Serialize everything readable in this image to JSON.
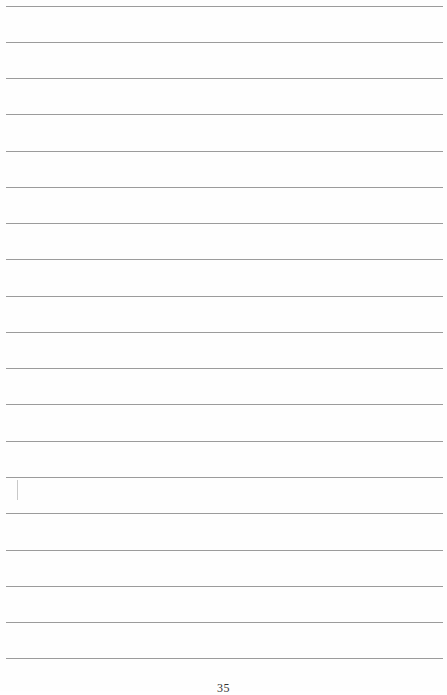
{
  "document": {
    "type": "lined-notebook-page",
    "rule_count": 19,
    "rule_color": "#8a8a8a",
    "rule_positions_y": [
      6,
      42,
      78,
      114,
      151,
      187,
      223,
      259,
      296,
      332,
      368,
      404,
      441,
      477,
      513,
      550,
      586,
      622,
      658
    ],
    "page_number": "35"
  }
}
